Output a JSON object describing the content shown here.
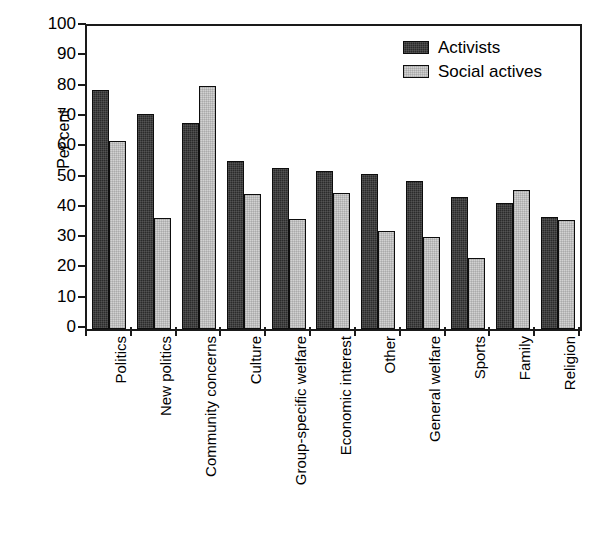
{
  "chart_data": {
    "type": "bar",
    "title": "",
    "subtitle": "",
    "xlabel": "",
    "ylabel": "Per cent",
    "ylim": [
      0,
      100
    ],
    "ytick_step": 10,
    "yticks": [
      100,
      90,
      80,
      70,
      60,
      50,
      40,
      30,
      20,
      10,
      0
    ],
    "grid": false,
    "legend_position": "top-right",
    "orientation": "vertical",
    "x_tick_label_rotation": -90,
    "categories": [
      "Politics",
      "New politics",
      "Community concerns",
      "Culture",
      "Group-specific welfare",
      "Economic interest",
      "Other",
      "General welfare",
      "Sports",
      "Family",
      "Religion"
    ],
    "series": [
      {
        "name": "Activists",
        "color": "#2b2b2b",
        "values": [
          79,
          71,
          68,
          55.5,
          53,
          52,
          51,
          49,
          43.5,
          41.5,
          37
        ]
      },
      {
        "name": "Social actives",
        "color": "#d2d2d2",
        "values": [
          62,
          36.5,
          80.2,
          44.5,
          36.2,
          45,
          32.5,
          30.5,
          23.5,
          46,
          36
        ]
      }
    ]
  },
  "legend": {
    "items": [
      {
        "label": "Activists",
        "swatch": "dark"
      },
      {
        "label": "Social actives",
        "swatch": "light"
      }
    ]
  }
}
